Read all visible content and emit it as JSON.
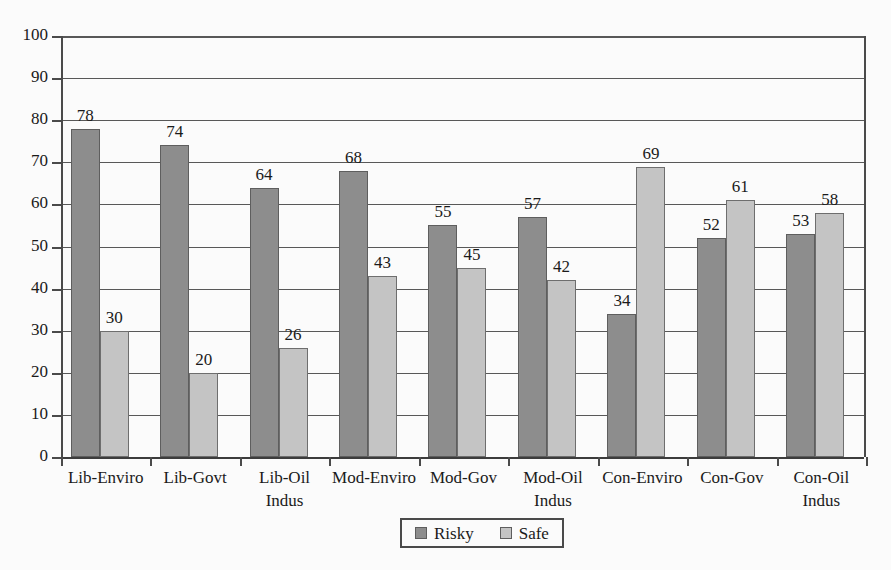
{
  "chart_data": {
    "type": "bar",
    "title": "",
    "subtitle": "",
    "xlabel": "",
    "ylabel": "",
    "ylim": [
      0,
      100
    ],
    "ytick_step": 10,
    "yticks": [
      0,
      10,
      20,
      30,
      40,
      50,
      60,
      70,
      80,
      90,
      100
    ],
    "ytick_labels": [
      "0",
      "10",
      "20",
      "30",
      "40",
      "50",
      "60",
      "70",
      "80",
      "90",
      "100"
    ],
    "grid": true,
    "grid_axis": "y",
    "legend_position": "bottom-center",
    "show_value_labels": true,
    "categories": [
      "Lib-Enviro",
      "Lib-Govt",
      "Lib-Oil Indus",
      "Mod-Enviro",
      "Mod-Gov",
      "Mod-Oil Indus",
      "Con-Enviro",
      "Con-Gov",
      "Con-Oil Indus"
    ],
    "category_lines": [
      [
        "Lib-Enviro"
      ],
      [
        "Lib-Govt"
      ],
      [
        "Lib-Oil",
        "Indus"
      ],
      [
        "Mod-Enviro"
      ],
      [
        "Mod-Gov"
      ],
      [
        "Mod-Oil",
        "Indus"
      ],
      [
        "Con-Enviro"
      ],
      [
        "Con-Gov"
      ],
      [
        "Con-Oil",
        "Indus"
      ]
    ],
    "series": [
      {
        "name": "Risky",
        "color": "#8d8d8d",
        "values": [
          78,
          74,
          64,
          68,
          55,
          57,
          34,
          52,
          53
        ]
      },
      {
        "name": "Safe",
        "color": "#c4c4c4",
        "values": [
          30,
          20,
          26,
          43,
          45,
          42,
          69,
          61,
          58
        ]
      }
    ]
  },
  "legend": {
    "items": [
      {
        "label": "Risky",
        "swatch": "risky-swatch"
      },
      {
        "label": "Safe",
        "swatch": "safe-swatch"
      }
    ]
  }
}
